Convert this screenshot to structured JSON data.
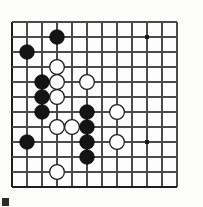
{
  "figure": {
    "name": "go-board-diagram",
    "kind": "go-board-position"
  },
  "board": {
    "visible_columns": 12,
    "visible_rows": 12,
    "origin_x": 12,
    "origin_y": 22,
    "cell_size": 15,
    "line_color": "#4a4a4a",
    "edge_color": "#1d1d1d",
    "background_color": "#fcfcfa",
    "left_edge_is_board_edge": true,
    "bottom_edge_is_board_edge": true
  },
  "star_points": [
    {
      "col": 9,
      "row": 1,
      "label": "hoshi-upper-right"
    },
    {
      "col": 9,
      "row": 8,
      "label": "hoshi-lower-right"
    }
  ],
  "stones": {
    "black_count": 10,
    "white_count": 10,
    "black": [
      {
        "col": 3,
        "row": 1,
        "label": "black-c1"
      },
      {
        "col": 1,
        "row": 2,
        "label": "black-a2"
      },
      {
        "col": 2,
        "row": 4,
        "label": "black-b4"
      },
      {
        "col": 2,
        "row": 5,
        "label": "black-b5"
      },
      {
        "col": 2,
        "row": 6,
        "label": "black-b6"
      },
      {
        "col": 5,
        "row": 6,
        "label": "black-e6"
      },
      {
        "col": 5,
        "row": 7,
        "label": "black-e7"
      },
      {
        "col": 5,
        "row": 8,
        "label": "black-e8"
      },
      {
        "col": 1,
        "row": 8,
        "label": "black-a8"
      },
      {
        "col": 5,
        "row": 9,
        "label": "black-e9-ghost"
      }
    ],
    "white": [
      {
        "col": 3,
        "row": 3,
        "label": "white-c3"
      },
      {
        "col": 3,
        "row": 4,
        "label": "white-c4"
      },
      {
        "col": 3,
        "row": 5,
        "label": "white-c5"
      },
      {
        "col": 5,
        "row": 4,
        "label": "white-e4"
      },
      {
        "col": 7,
        "row": 6,
        "label": "white-g6"
      },
      {
        "col": 3,
        "row": 7,
        "label": "white-c7"
      },
      {
        "col": 4,
        "row": 7,
        "label": "white-d7"
      },
      {
        "col": 7,
        "row": 8,
        "label": "white-g8"
      },
      {
        "col": 3,
        "row": 10,
        "label": "white-c10"
      },
      {
        "col": 0,
        "row": 0,
        "label": "white-unused"
      }
    ]
  },
  "colors": {
    "black_stone": "#141414",
    "white_stone": "#fdfdfd",
    "stone_outline": "#1a1a1a",
    "star": "#1a1a1a",
    "corner_mark": "#2b2b2b"
  },
  "corner_mark": {
    "present": true,
    "label": "page-corner-mark"
  }
}
